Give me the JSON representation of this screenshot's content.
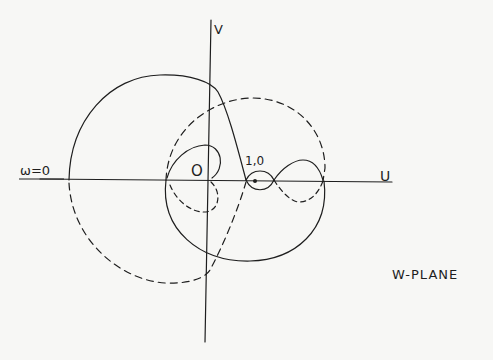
{
  "diagram": {
    "title": "W-PLANE",
    "axes": {
      "horizontal_label": "U",
      "vertical_label": "V"
    },
    "labels": {
      "omega_zero": "ω=0",
      "origin": "O",
      "critical_point": "1,0"
    },
    "curves": [
      {
        "name": "solid-locus",
        "style": "solid"
      },
      {
        "name": "dashed-locus",
        "style": "dashed"
      }
    ],
    "colors": {
      "background": "#f7f7f5",
      "ink": "#1e1e1e"
    }
  }
}
